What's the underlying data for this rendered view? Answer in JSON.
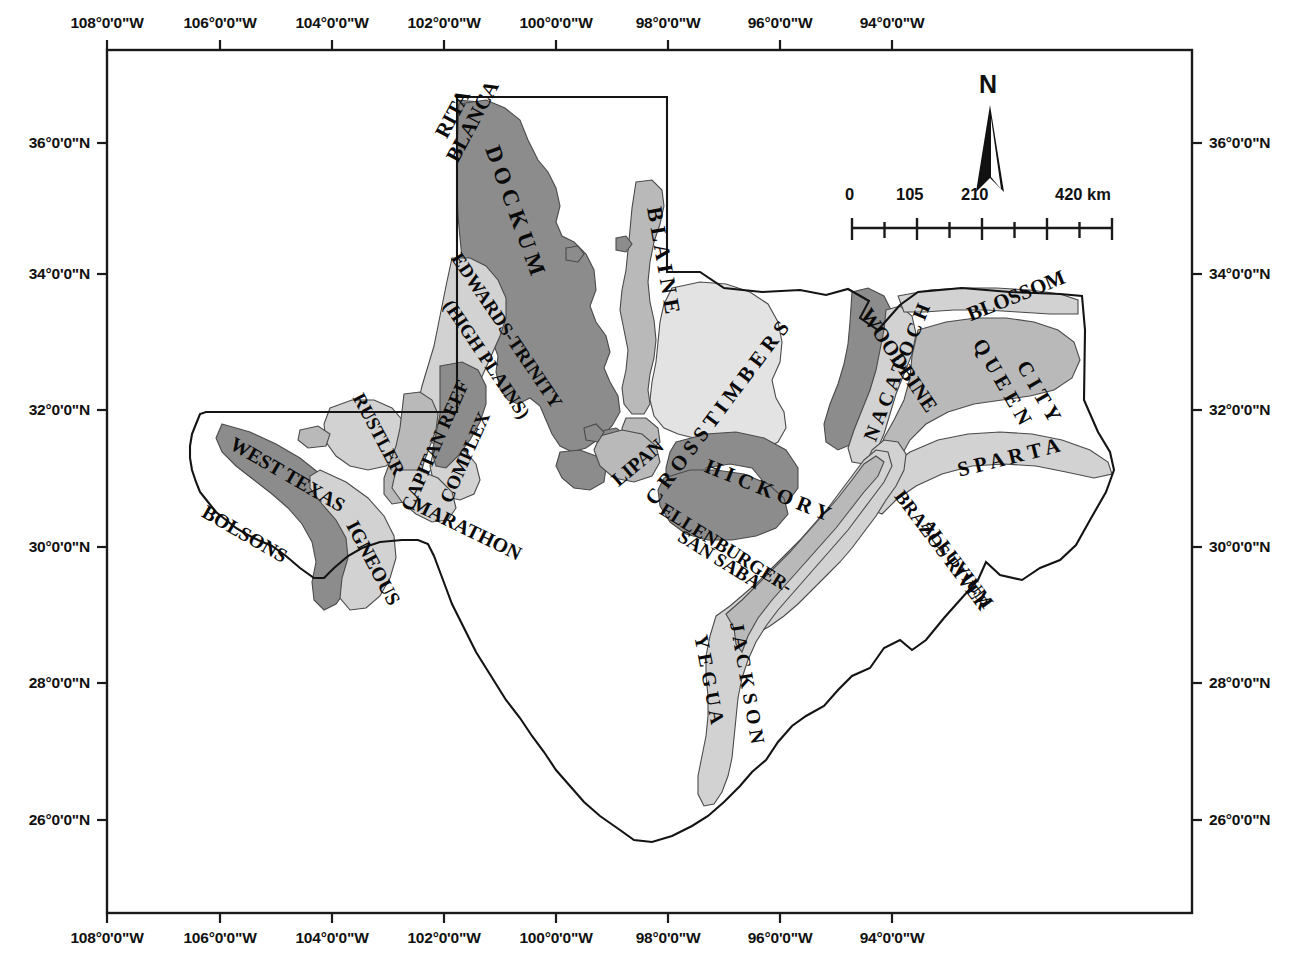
{
  "figure": {
    "kind": "map",
    "caption": ""
  },
  "frame": {
    "x": 107,
    "y": 50,
    "w": 1085,
    "h": 863,
    "border_color": "#1a1a1a"
  },
  "axes": {
    "lon_ticks": [
      {
        "label": "108°0'0\"W",
        "value": -108,
        "x": 107
      },
      {
        "label": "106°0'0\"W",
        "value": -106,
        "x": 220
      },
      {
        "label": "104°0'0\"W",
        "value": -104,
        "x": 332
      },
      {
        "label": "102°0'0\"W",
        "value": -102,
        "x": 444
      },
      {
        "label": "100°0'0\"W",
        "value": -100,
        "x": 556
      },
      {
        "label": "98°0'0\"W",
        "value": -98,
        "x": 668
      },
      {
        "label": "96°0'0\"W",
        "value": -96,
        "x": 780
      },
      {
        "label": "94°0'0\"W",
        "value": -94,
        "x": 892
      }
    ],
    "lat_ticks": [
      {
        "label": "36°0'0\"N",
        "value": 36,
        "y": 143
      },
      {
        "label": "34°0'0\"N",
        "value": 34,
        "y": 274
      },
      {
        "label": "32°0'0\"N",
        "value": 32,
        "y": 410
      },
      {
        "label": "30°0'0\"N",
        "value": 30,
        "y": 547
      },
      {
        "label": "28°0'0\"N",
        "value": 28,
        "y": 683
      },
      {
        "label": "26°0'0\"N",
        "value": 26,
        "y": 820
      }
    ]
  },
  "north_arrow": {
    "label": "N"
  },
  "scale_bar": {
    "unit": "km",
    "labels": [
      {
        "text": "0",
        "value": 0,
        "frac": 0.0
      },
      {
        "text": "105",
        "value": 105,
        "frac": 0.25
      },
      {
        "text": "210",
        "value": 210,
        "frac": 0.5
      },
      {
        "text": "420 km",
        "value": 420,
        "frac": 1.0
      }
    ],
    "segments": 8
  },
  "legend_shades": {
    "dark": "#8c8c8c",
    "medium": "#b9b9b9",
    "light": "#d2d2d2",
    "pale": "#e3e3e3",
    "white": "#ffffff",
    "outline": "#4a4a4a"
  },
  "aquifer_labels": [
    {
      "id": "rita-blanca",
      "text": "RITA",
      "x": 441,
      "y": 126,
      "rot": -62,
      "size": 21
    },
    {
      "id": "rita-blanca-2",
      "text": "BLANCA",
      "x": 452,
      "y": 150,
      "rot": -62,
      "size": 21
    },
    {
      "id": "dockum",
      "text": "D O C K U M",
      "x": 492,
      "y": 135,
      "rot": 70,
      "size": 23
    },
    {
      "id": "edwards-trinity",
      "text": "EDWARDS-TRINITY",
      "x": 456,
      "y": 245,
      "rot": 56,
      "size": 19
    },
    {
      "id": "edwards-trinity-2",
      "text": "(HIGH PLAINS)",
      "x": 448,
      "y": 292,
      "rot": 56,
      "size": 19
    },
    {
      "id": "blaine",
      "text": "B L A I N E",
      "x": 654,
      "y": 196,
      "rot": 80,
      "size": 22
    },
    {
      "id": "rustler",
      "text": "RUSTLER",
      "x": 358,
      "y": 385,
      "rot": 62,
      "size": 19
    },
    {
      "id": "capitan-reef",
      "text": "CAPITAN REEF",
      "x": 406,
      "y": 500,
      "rot": -66,
      "size": 19
    },
    {
      "id": "capitan-complex",
      "text": "COMPLEX",
      "x": 445,
      "y": 492,
      "rot": -66,
      "size": 19
    },
    {
      "id": "west-texas-bolsons",
      "text": "WEST TEXAS",
      "x": 232,
      "y": 432,
      "rot": 30,
      "size": 20
    },
    {
      "id": "west-texas-bolsons-2",
      "text": "BOLSONS",
      "x": 204,
      "y": 500,
      "rot": 30,
      "size": 20
    },
    {
      "id": "igneous",
      "text": "IGNEOUS",
      "x": 352,
      "y": 512,
      "rot": 62,
      "size": 20
    },
    {
      "id": "marathon",
      "text": "MARATHON",
      "x": 413,
      "y": 492,
      "rot": 26,
      "size": 20
    },
    {
      "id": "cross-timbers",
      "text": "C R O S S   T I M B E R S",
      "x": 650,
      "y": 492,
      "rot": -53,
      "size": 21
    },
    {
      "id": "lipan",
      "text": "LIPAN",
      "x": 614,
      "y": 472,
      "rot": -40,
      "size": 20
    },
    {
      "id": "hickory",
      "text": "H I C K O R Y",
      "x": 706,
      "y": 455,
      "rot": 22,
      "size": 21
    },
    {
      "id": "ellenburger",
      "text": "ELLENBURGER-",
      "x": 662,
      "y": 498,
      "rot": 32,
      "size": 19
    },
    {
      "id": "san-saba",
      "text": "SAN SABA",
      "x": 680,
      "y": 525,
      "rot": 32,
      "size": 19
    },
    {
      "id": "woodbine",
      "text": "WOODBINE",
      "x": 865,
      "y": 300,
      "rot": 56,
      "size": 21
    },
    {
      "id": "nacatoch",
      "text": "N A C A T O C H",
      "x": 869,
      "y": 430,
      "rot": -68,
      "size": 20
    },
    {
      "id": "blossom",
      "text": "BLOSSOM",
      "x": 968,
      "y": 305,
      "rot": -22,
      "size": 21
    },
    {
      "id": "queen-city",
      "text": "Q U E E N",
      "x": 978,
      "y": 330,
      "rot": 60,
      "size": 21
    },
    {
      "id": "queen-city-2",
      "text": "C I T Y",
      "x": 1022,
      "y": 352,
      "rot": 60,
      "size": 21
    },
    {
      "id": "sparta",
      "text": "S P A R T A",
      "x": 958,
      "y": 460,
      "rot": -14,
      "size": 21
    },
    {
      "id": "brazos-river",
      "text": "BRAZOS RIVER",
      "x": 899,
      "y": 483,
      "rot": 53,
      "size": 19
    },
    {
      "id": "brazos-alluvium",
      "text": "ALLUVIUM",
      "x": 926,
      "y": 512,
      "rot": 53,
      "size": 19
    },
    {
      "id": "yegua",
      "text": "Y E G U A",
      "x": 701,
      "y": 625,
      "rot": 79,
      "size": 20
    },
    {
      "id": "jackson",
      "text": "J A C K S O N",
      "x": 737,
      "y": 612,
      "rot": 80,
      "size": 20
    }
  ]
}
